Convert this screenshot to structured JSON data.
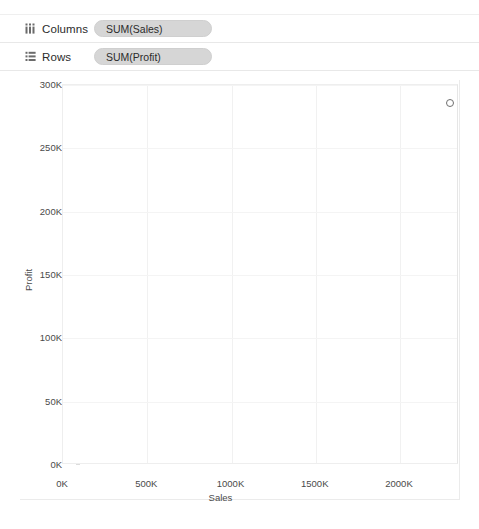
{
  "shelves": [
    {
      "icon": "columns-icon",
      "label": "Columns",
      "pill": "SUM(Sales)",
      "name": "columns"
    },
    {
      "icon": "rows-icon",
      "label": "Rows",
      "pill": "SUM(Profit)",
      "name": "rows"
    }
  ],
  "chart_data": {
    "type": "scatter",
    "title": "",
    "xlabel": "Sales",
    "ylabel": "Profit",
    "xlim": [
      0,
      2350
    ],
    "ylim": [
      0,
      300
    ],
    "xunit": "K",
    "yunit": "K",
    "grid": true,
    "legend": "none",
    "xticks": [
      "0K",
      "500K",
      "1000K",
      "1500K",
      "2000K"
    ],
    "xtick_values": [
      0,
      500,
      1000,
      1500,
      2000
    ],
    "yticks": [
      "0K",
      "50K",
      "100K",
      "150K",
      "200K",
      "250K",
      "300K"
    ],
    "ytick_values": [
      0,
      50,
      100,
      150,
      200,
      250,
      300
    ],
    "series": [
      {
        "name": "SUM(Sales) vs SUM(Profit)",
        "marker": "open-circle",
        "color": "#6f6f6f",
        "points": [
          {
            "x": 2297,
            "y": 286
          }
        ]
      }
    ]
  },
  "colors": {
    "pill_background": "#d6d6d6",
    "grid": "#f1f1f1",
    "axis_text": "#4a4a4a",
    "marker_stroke": "#6f6f6f"
  }
}
